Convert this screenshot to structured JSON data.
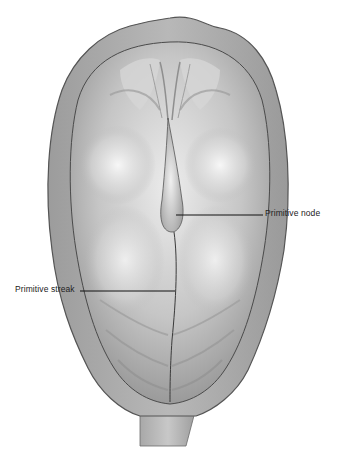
{
  "figure": {
    "labels": [
      {
        "id": "node",
        "text": "Primitive node"
      },
      {
        "id": "streak",
        "text": "Primitive streak"
      }
    ],
    "colors": {
      "background": "#ffffff",
      "outer_rim": "#a9a9a9",
      "rim_outline": "#5a5a5a",
      "disc_light": "#e6e6e6",
      "disc_mid": "#bdbdbd",
      "disc_dark": "#8e8e8e",
      "leader_line": "#111111"
    }
  }
}
